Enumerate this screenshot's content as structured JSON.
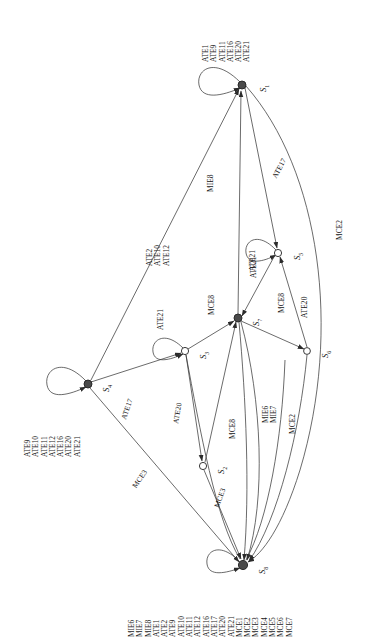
{
  "figure": {
    "kind": "state-transition-diagram",
    "orientation": "rotated-90-ccw",
    "background": "#ffffff",
    "stroke": "#333333",
    "text_color": "#141414"
  },
  "states": [
    {
      "id": "S1",
      "label": "S",
      "sub": "1",
      "x": 242,
      "y": 85,
      "filled": true,
      "r": 4.0
    },
    {
      "id": "S5",
      "label": "S",
      "sub": "5",
      "x": 278,
      "y": 253,
      "filled": false,
      "r": 3.6
    },
    {
      "id": "S6",
      "label": "S",
      "sub": "6",
      "x": 307,
      "y": 351,
      "filled": false,
      "r": 3.4
    },
    {
      "id": "S7",
      "label": "S",
      "sub": "7",
      "x": 238,
      "y": 318,
      "filled": true,
      "r": 4.0
    },
    {
      "id": "S3",
      "label": "S",
      "sub": "3",
      "x": 185,
      "y": 351,
      "filled": false,
      "r": 3.6
    },
    {
      "id": "S4",
      "label": "S",
      "sub": "4",
      "x": 88,
      "y": 384,
      "filled": true,
      "r": 4.0
    },
    {
      "id": "S2",
      "label": "S",
      "sub": "2",
      "x": 203,
      "y": 466,
      "filled": false,
      "r": 3.6
    },
    {
      "id": "S8",
      "label": "S",
      "sub": "8",
      "x": 243,
      "y": 565,
      "filled": true,
      "r": 4.6
    }
  ],
  "self_loops": [
    {
      "state": "S1",
      "events": [
        "ATE1",
        "ATE9",
        "ATE11",
        "ATE16",
        "ATE20",
        "ATE21"
      ]
    },
    {
      "state": "S4",
      "events": [
        "ATE9",
        "ATE10",
        "ATE11",
        "ATE12",
        "ATE16",
        "ATE20",
        "ATE21"
      ]
    },
    {
      "state": "S5",
      "events": [
        "ATE21"
      ]
    },
    {
      "state": "S3",
      "events": [
        "ATE21"
      ]
    },
    {
      "state": "S8",
      "events": [
        "MIE6",
        "MIE7",
        "MIE8",
        "ATE1",
        "ATE2",
        "ATE9",
        "ATE10",
        "ATE11",
        "ATE12",
        "ATE16",
        "ATE17",
        "ATE20",
        "ATE21",
        "MCE1",
        "MCE2",
        "MCE3",
        "MCE4",
        "MCE5",
        "MCE6",
        "MCE7"
      ]
    }
  ],
  "edge_labels": [
    {
      "id": "e-s4-s1",
      "events": [
        "ATE2",
        "ATE10",
        "ATE12"
      ],
      "x": 152,
      "y": 252
    },
    {
      "id": "e-s7-s1",
      "events": [
        "MIE8"
      ],
      "x": 206,
      "y": 185
    },
    {
      "id": "e-s1-s5",
      "events": [
        "ATE17"
      ],
      "x": 269,
      "y": 168
    },
    {
      "id": "e-s1-s8",
      "events": [
        "MCE2"
      ],
      "x": 335,
      "y": 232
    },
    {
      "id": "e-s5-s7",
      "events": [
        "ATE21"
      ],
      "x": 249,
      "y": 270
    },
    {
      "id": "e-s3-s7",
      "events": [
        "MCE8"
      ],
      "x": 207,
      "y": 307
    },
    {
      "id": "e-s7-s6",
      "events": [
        "MCE8"
      ],
      "x": 277,
      "y": 305
    },
    {
      "id": "e-s6-s5",
      "events": [
        "ATE20"
      ],
      "x": 300,
      "y": 310
    },
    {
      "id": "e-s4-s3",
      "events": [
        "ATE17"
      ],
      "x": 119,
      "y": 409
    },
    {
      "id": "e-s3-s2",
      "events": [
        "ATE20"
      ],
      "x": 171,
      "y": 414
    },
    {
      "id": "e-s2-s7",
      "events": [
        "MCE8"
      ],
      "x": 228,
      "y": 430
    },
    {
      "id": "e-s7-s8a",
      "events": [
        "MIE6",
        "MIE7"
      ],
      "x": 265,
      "y": 414
    },
    {
      "id": "e-s6-s8",
      "events": [
        "MCE2"
      ],
      "x": 297,
      "y": 425
    },
    {
      "id": "e-s4-s8",
      "events": [
        "MCE3"
      ],
      "x": 130,
      "y": 476
    },
    {
      "id": "e-s2-s8",
      "events": [
        "MCE3"
      ],
      "x": 212,
      "y": 497
    }
  ],
  "event_catalog": {
    "ATE": [
      "ATE1",
      "ATE2",
      "ATE9",
      "ATE10",
      "ATE11",
      "ATE12",
      "ATE16",
      "ATE17",
      "ATE20",
      "ATE21"
    ],
    "MIE": [
      "MIE6",
      "MIE7",
      "MIE8"
    ],
    "MCE": [
      "MCE1",
      "MCE2",
      "MCE3",
      "MCE4",
      "MCE5",
      "MCE6",
      "MCE7",
      "MCE8"
    ]
  }
}
